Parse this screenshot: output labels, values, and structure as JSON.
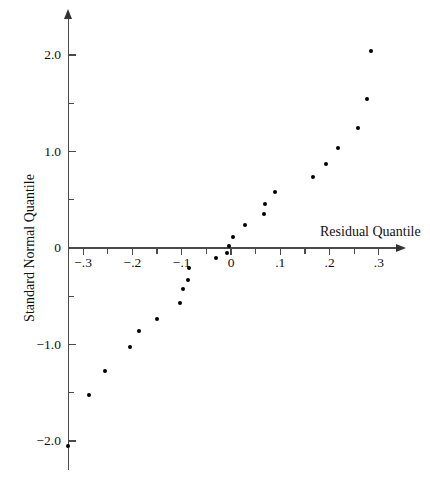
{
  "chart_data": {
    "type": "scatter",
    "title": "",
    "xlabel": "Residual Quantile",
    "ylabel": "Standard Normal Quantile",
    "xlim": [
      -0.34,
      0.345
    ],
    "ylim": [
      -2.15,
      2.4
    ],
    "grid": false,
    "legend": null,
    "x_ticks": [
      {
        "value": -0.3,
        "label": "−.3",
        "major": true
      },
      {
        "value": -0.25,
        "label": "",
        "major": false
      },
      {
        "value": -0.2,
        "label": "−.2",
        "major": true
      },
      {
        "value": -0.15,
        "label": "",
        "major": false
      },
      {
        "value": -0.1,
        "label": "−.1",
        "major": true
      },
      {
        "value": -0.05,
        "label": "",
        "major": false
      },
      {
        "value": 0.0,
        "label": "0",
        "major": true
      },
      {
        "value": 0.05,
        "label": "",
        "major": false
      },
      {
        "value": 0.1,
        "label": ".1",
        "major": true
      },
      {
        "value": 0.15,
        "label": "",
        "major": false
      },
      {
        "value": 0.2,
        "label": ".2",
        "major": true
      },
      {
        "value": 0.25,
        "label": "",
        "major": false
      },
      {
        "value": 0.3,
        "label": ".3",
        "major": true
      }
    ],
    "y_ticks": [
      {
        "value": 2.0,
        "label": "2.0",
        "major": true
      },
      {
        "value": 1.5,
        "label": "",
        "major": false
      },
      {
        "value": 1.0,
        "label": "1.0",
        "major": true
      },
      {
        "value": 0.5,
        "label": "",
        "major": false
      },
      {
        "value": 0.0,
        "label": "0",
        "major": true
      },
      {
        "value": -0.5,
        "label": "",
        "major": false
      },
      {
        "value": -1.0,
        "label": "−1.0",
        "major": true
      },
      {
        "value": -1.5,
        "label": "",
        "major": false
      },
      {
        "value": -2.0,
        "label": "−2.0",
        "major": true
      }
    ],
    "points": [
      {
        "x": -0.331,
        "y": -2.05
      },
      {
        "x": -0.289,
        "y": -1.52
      },
      {
        "x": -0.255,
        "y": -1.27
      },
      {
        "x": -0.205,
        "y": -1.03
      },
      {
        "x": -0.187,
        "y": -0.86
      },
      {
        "x": -0.15,
        "y": -0.74
      },
      {
        "x": -0.103,
        "y": -0.57
      },
      {
        "x": -0.097,
        "y": -0.43
      },
      {
        "x": -0.087,
        "y": -0.33
      },
      {
        "x": -0.085,
        "y": -0.21
      },
      {
        "x": -0.03,
        "y": -0.1
      },
      {
        "x": -0.008,
        "y": -0.05
      },
      {
        "x": -0.004,
        "y": 0.02
      },
      {
        "x": 0.005,
        "y": 0.11
      },
      {
        "x": 0.028,
        "y": 0.24
      },
      {
        "x": 0.067,
        "y": 0.35
      },
      {
        "x": 0.069,
        "y": 0.46
      },
      {
        "x": 0.089,
        "y": 0.58
      },
      {
        "x": 0.166,
        "y": 0.74
      },
      {
        "x": 0.192,
        "y": 0.87
      },
      {
        "x": 0.218,
        "y": 1.04
      },
      {
        "x": 0.258,
        "y": 1.24
      },
      {
        "x": 0.275,
        "y": 1.54
      },
      {
        "x": 0.283,
        "y": 2.04
      }
    ]
  },
  "axes": {
    "x_title": "Residual Quantile",
    "y_title": "Standard Normal Quantile"
  },
  "style": {
    "point_color": "#000000",
    "axis_color": "#4a4a4a",
    "background": "#ffffff"
  }
}
